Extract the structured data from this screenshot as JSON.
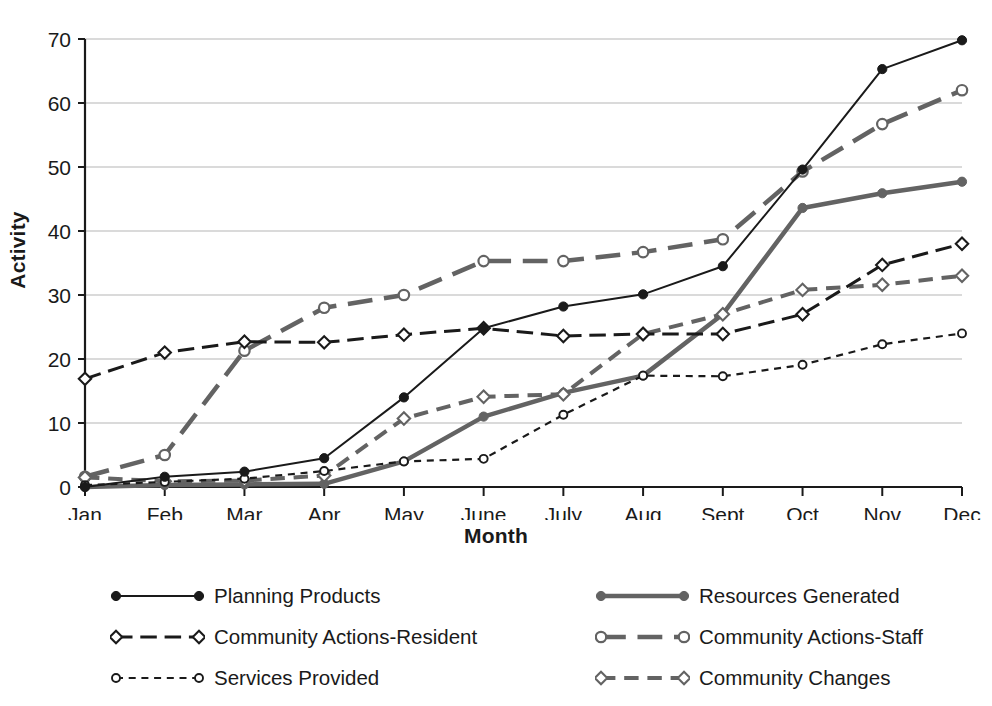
{
  "chart_data": {
    "type": "line",
    "title": "",
    "xlabel": "Month",
    "ylabel": "Activity",
    "categories": [
      "Jan",
      "Feb",
      "Mar",
      "Apr",
      "May",
      "June",
      "July",
      "Aug",
      "Sept",
      "Oct",
      "Nov",
      "Dec"
    ],
    "ylim": [
      0,
      70
    ],
    "yticks": [
      0,
      10,
      20,
      30,
      40,
      50,
      60,
      70
    ],
    "grid": true,
    "legend_position": "below",
    "series": [
      {
        "name": "Planning Products",
        "color": "#1a1a1a",
        "style": "solid",
        "marker": "filled-circle",
        "width": 2,
        "values": [
          0,
          1.6,
          2.4,
          4.5,
          14,
          24.8,
          28.2,
          30.1,
          34.5,
          49.6,
          65.3,
          69.8
        ]
      },
      {
        "name": "Resources Generated",
        "color": "#636363",
        "style": "solid",
        "marker": "filled-circle",
        "width": 4.5,
        "values": [
          0,
          0.3,
          0.4,
          0.5,
          4,
          11,
          14.7,
          17.4,
          27,
          43.6,
          45.9,
          47.7
        ]
      },
      {
        "name": "Community Actions-Resident",
        "color": "#1a1a1a",
        "style": "long-dash",
        "marker": "open-diamond",
        "width": 3,
        "values": [
          16.9,
          21,
          22.7,
          22.6,
          23.8,
          24.8,
          23.6,
          23.9,
          23.9,
          27,
          34.7,
          38
        ]
      },
      {
        "name": "Community Actions-Staff",
        "color": "#636363",
        "style": "long-dash",
        "marker": "open-circle",
        "width": 4.5,
        "values": [
          1.6,
          5,
          21.3,
          28,
          30,
          35.3,
          35.3,
          36.7,
          38.7,
          49.3,
          56.7,
          62
        ]
      },
      {
        "name": "Services Provided",
        "color": "#1a1a1a",
        "style": "short-dash",
        "marker": "open-circle-small",
        "width": 2.2,
        "values": [
          0.3,
          0.8,
          1.3,
          2.5,
          4,
          4.4,
          11.3,
          17.4,
          17.3,
          19.1,
          22.3,
          24
        ]
      },
      {
        "name": "Community Changes",
        "color": "#636363",
        "style": "med-dash",
        "marker": "open-diamond",
        "width": 4,
        "values": [
          1.5,
          0.9,
          1,
          1.8,
          10.7,
          14.1,
          14.5,
          23.9,
          27,
          30.8,
          31.6,
          33
        ]
      }
    ]
  },
  "axes": {
    "ylabel": "Activity",
    "xlabel": "Month"
  },
  "legend": {
    "left_column": [
      {
        "label": "Planning Products",
        "series_index": 0
      },
      {
        "label": "Community Actions-Resident",
        "series_index": 2
      },
      {
        "label": "Services Provided",
        "series_index": 4
      }
    ],
    "right_column": [
      {
        "label": "Resources Generated",
        "series_index": 1
      },
      {
        "label": "Community Actions-Staff",
        "series_index": 3
      },
      {
        "label": "Community Changes",
        "series_index": 5
      }
    ]
  },
  "colors": {
    "black": "#1a1a1a",
    "gray": "#636363",
    "gridline": "#b5b5b5",
    "background": "#ffffff"
  }
}
